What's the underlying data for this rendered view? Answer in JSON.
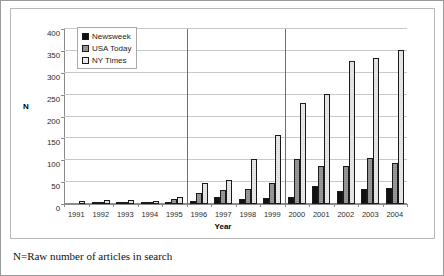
{
  "figure": {
    "caption": "N=Raw number of articles in search"
  },
  "chart_data": {
    "type": "bar",
    "title": "",
    "xlabel": "Year",
    "ylabel": "N",
    "ylim": [
      0,
      400
    ],
    "ytick_step": 50,
    "yticks": [
      "400",
      "350",
      "300",
      "250",
      "200",
      "150",
      "100",
      "50",
      "0"
    ],
    "grid": true,
    "legend_position": "top-left",
    "categories": [
      "1991",
      "1992",
      "1993",
      "1994",
      "1995",
      "1996",
      "1997",
      "1998",
      "1999",
      "2000",
      "2001",
      "2002",
      "2003",
      "2004"
    ],
    "series": [
      {
        "name": "Newsweek",
        "color": "#111111",
        "values": [
          0,
          1,
          2,
          3,
          5,
          6,
          16,
          12,
          14,
          15,
          42,
          30,
          35,
          36
        ]
      },
      {
        "name": "USA Today",
        "color": "#959595",
        "values": [
          0,
          1,
          2,
          4,
          12,
          25,
          32,
          35,
          47,
          102,
          87,
          88,
          106,
          93
        ]
      },
      {
        "name": "NY Times",
        "color": "#e4e4e4",
        "values": [
          6,
          9,
          9,
          8,
          17,
          47,
          55,
          103,
          158,
          231,
          252,
          326,
          333,
          353
        ]
      }
    ],
    "reference_lines": [
      {
        "after_category": "1995",
        "orientation": "vertical"
      },
      {
        "after_category": "1999",
        "orientation": "vertical"
      }
    ]
  }
}
